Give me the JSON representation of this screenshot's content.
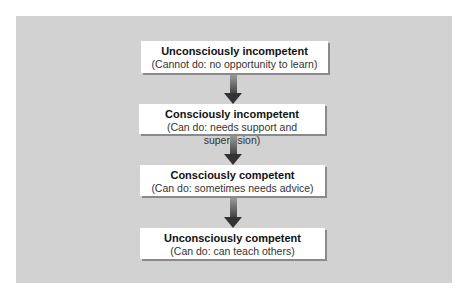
{
  "diagram": {
    "type": "flowchart",
    "direction": "top-to-bottom",
    "colors": {
      "panel_background": "#d2d2d2",
      "box_background": "#ffffff",
      "box_shadow": "#8a8a8a",
      "arrow_top": "#9a9a9a",
      "arrow_bottom": "#333333",
      "text": "#111111"
    },
    "stages": [
      {
        "title": "Unconsciously incompetent",
        "subtitle": "(Cannot do: no opportunity to learn)"
      },
      {
        "title": "Consciously incompetent",
        "subtitle": "(Can do: needs support and supervision)"
      },
      {
        "title": "Consciously competent",
        "subtitle": "(Can do: sometimes needs advice)"
      },
      {
        "title": "Unconsciously competent",
        "subtitle": "(Can do: can teach others)"
      }
    ],
    "connections": [
      {
        "from": 0,
        "to": 1,
        "icon": "arrow-down-icon"
      },
      {
        "from": 1,
        "to": 2,
        "icon": "arrow-down-icon"
      },
      {
        "from": 2,
        "to": 3,
        "icon": "arrow-down-icon"
      }
    ]
  }
}
